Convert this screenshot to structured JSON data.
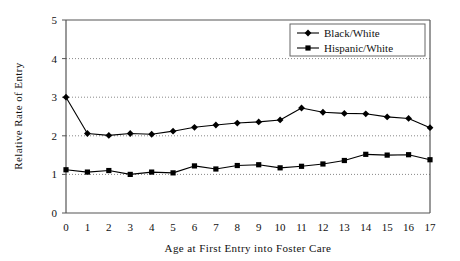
{
  "chart_data": {
    "type": "line",
    "title": "",
    "xlabel": "Age at First Entry into Foster Care",
    "ylabel": "Relative Rate of Entry",
    "x": [
      0,
      1,
      2,
      3,
      4,
      5,
      6,
      7,
      8,
      9,
      10,
      11,
      12,
      13,
      14,
      15,
      16,
      17
    ],
    "xtick_labels": [
      "0",
      "1",
      "2",
      "3",
      "4",
      "5",
      "6",
      "7",
      "8",
      "9",
      "10",
      "11",
      "12",
      "13",
      "14",
      "15",
      "16",
      "17"
    ],
    "ytick_labels": [
      "0",
      "1",
      "2",
      "3",
      "4",
      "5"
    ],
    "xlim": [
      0,
      17
    ],
    "ylim": [
      0,
      5
    ],
    "ytick_values": [
      0,
      1,
      2,
      3,
      4,
      5
    ],
    "grid": "horizontal dotted gridlines at y = 1, 2, 3, 4",
    "legend_position": "top-right inside plot area",
    "series": [
      {
        "name": "Black/White",
        "marker": "diamond",
        "color": "#000000",
        "values": [
          3.0,
          2.06,
          2.01,
          2.06,
          2.04,
          2.12,
          2.22,
          2.28,
          2.33,
          2.36,
          2.41,
          2.72,
          2.61,
          2.58,
          2.57,
          2.49,
          2.45,
          2.21
        ]
      },
      {
        "name": "Hispanic/White",
        "marker": "square",
        "color": "#000000",
        "values": [
          1.12,
          1.06,
          1.1,
          1.0,
          1.06,
          1.04,
          1.22,
          1.14,
          1.23,
          1.25,
          1.17,
          1.21,
          1.27,
          1.36,
          1.52,
          1.5,
          1.51,
          1.38
        ]
      }
    ]
  },
  "legend": {
    "entries": [
      {
        "label": "Black/White"
      },
      {
        "label": "Hispanic/White"
      }
    ]
  },
  "axes": {
    "y_title": "Relative Rate of Entry",
    "x_title": "Age at First Entry into Foster Care"
  },
  "colors": {
    "line": "#000000",
    "gridline": "#888888",
    "axis": "#555555",
    "background": "#ffffff"
  }
}
